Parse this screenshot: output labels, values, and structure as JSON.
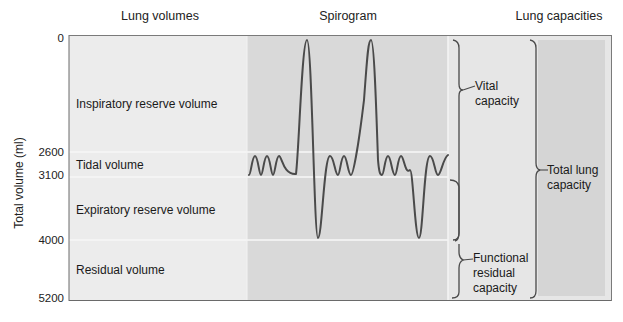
{
  "columns": {
    "lung_volumes": "Lung volumes",
    "spirogram": "Spirogram",
    "lung_capacities": "Lung capacities"
  },
  "y_axis": {
    "label": "Total volume (ml)",
    "ticks": [
      "0",
      "2600",
      "3100",
      "4000",
      "5200"
    ]
  },
  "volumes": [
    {
      "label": "Inspiratory reserve volume",
      "from": 0,
      "to": 2600
    },
    {
      "label": "Tidal volume",
      "from": 2600,
      "to": 3100
    },
    {
      "label": "Expiratory reserve volume",
      "from": 3100,
      "to": 4000
    },
    {
      "label": "Residual volume",
      "from": 4000,
      "to": 5200
    }
  ],
  "capacities": [
    {
      "label_line1": "Vital",
      "label_line2": "capacity",
      "label_line3": "",
      "from": 0,
      "to": 4000
    },
    {
      "label_line1": "Functional",
      "label_line2": "residual",
      "label_line3": "capacity",
      "from": 3100,
      "to": 5200
    },
    {
      "label_line1": "Total lung",
      "label_line2": "capacity",
      "label_line3": "",
      "from": 0,
      "to": 5200
    }
  ],
  "colors": {
    "volumes_bg": "#ececec",
    "spirogram_bg": "#d9d9d9",
    "capacities_bg": "#e4e4e4",
    "capacities_inner_bg": "#d6d6d6",
    "trace": "#4a4a4a",
    "divider": "#f6f6f6",
    "frame": "#6a6a6a"
  }
}
